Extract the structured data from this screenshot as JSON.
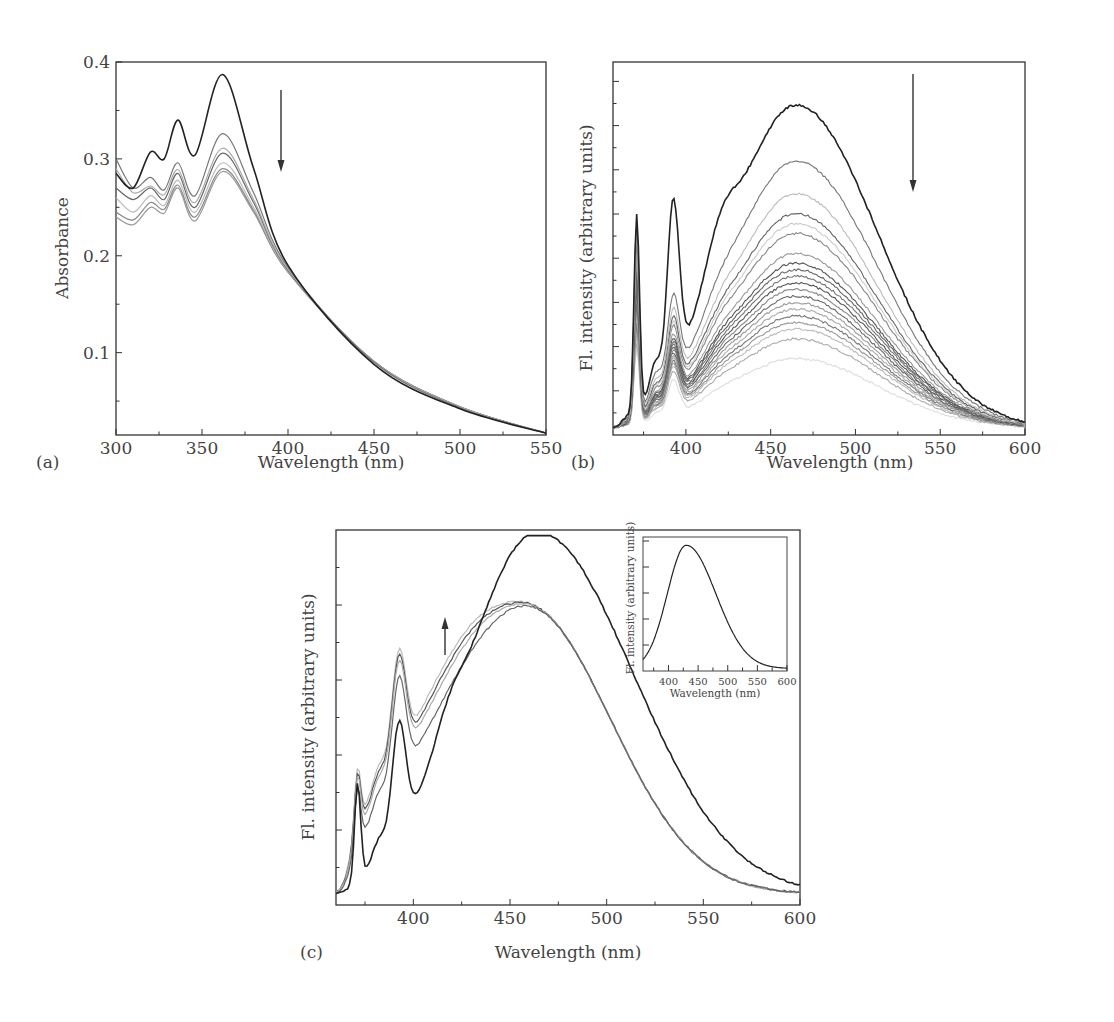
{
  "panels": {
    "a": {
      "tag": "(a)",
      "xlabel": "Wavelength (nm)",
      "ylabel": "Absorbance",
      "xticks": [
        "300",
        "350",
        "400",
        "450",
        "500",
        "550"
      ],
      "yticks": [
        "0.1",
        "0.2",
        "0.3",
        "0.4"
      ]
    },
    "b": {
      "tag": "(b)",
      "xlabel": "Wavelength (nm)",
      "ylabel": "Fl. intensity (arbitrary units)",
      "xticks": [
        "400",
        "450",
        "500",
        "550",
        "600"
      ]
    },
    "c": {
      "tag": "(c)",
      "xlabel": "Wavelength (nm)",
      "ylabel": "Fl. intensity (arbitrary units)",
      "xticks": [
        "400",
        "450",
        "500",
        "550",
        "600"
      ]
    },
    "inset": {
      "xlabel": "Wavelength (nm)",
      "ylabel": "Fl. intensity (arbitrary units)",
      "xticks": [
        "400",
        "450",
        "500",
        "550",
        "600"
      ]
    }
  },
  "chart_data": [
    {
      "panel": "a",
      "type": "line",
      "title": "",
      "xlabel": "Wavelength (nm)",
      "ylabel": "Absorbance",
      "xlim": [
        300,
        550
      ],
      "ylim": [
        0.015,
        0.4
      ],
      "x": [
        300,
        310,
        320,
        328,
        336,
        346,
        362,
        380,
        400,
        450,
        500,
        550
      ],
      "series": [
        {
          "name": "initial",
          "color": "#222222",
          "values": [
            0.285,
            0.27,
            0.307,
            0.3,
            0.34,
            0.304,
            0.387,
            0.29,
            0.19,
            0.088,
            0.042,
            0.017
          ]
        },
        {
          "name": "titration 1",
          "color": "#777777",
          "values": [
            0.3,
            0.27,
            0.281,
            0.268,
            0.296,
            0.262,
            0.326,
            0.265,
            0.188,
            0.09,
            0.043,
            0.017
          ]
        },
        {
          "name": "titration 2",
          "color": "#aaaaaa",
          "values": [
            0.29,
            0.265,
            0.272,
            0.263,
            0.289,
            0.255,
            0.311,
            0.258,
            0.186,
            0.091,
            0.044,
            0.017
          ]
        },
        {
          "name": "titration 3",
          "color": "#666666",
          "values": [
            0.27,
            0.258,
            0.27,
            0.258,
            0.285,
            0.25,
            0.306,
            0.255,
            0.185,
            0.091,
            0.044,
            0.017
          ]
        },
        {
          "name": "titration 4",
          "color": "#bbbbbb",
          "values": [
            0.26,
            0.245,
            0.262,
            0.252,
            0.278,
            0.245,
            0.296,
            0.25,
            0.184,
            0.091,
            0.044,
            0.017
          ]
        },
        {
          "name": "titration 5",
          "color": "#888888",
          "values": [
            0.245,
            0.237,
            0.255,
            0.248,
            0.273,
            0.24,
            0.29,
            0.247,
            0.183,
            0.091,
            0.044,
            0.017
          ]
        },
        {
          "name": "titration 6",
          "color": "#999999",
          "values": [
            0.24,
            0.232,
            0.25,
            0.244,
            0.27,
            0.236,
            0.287,
            0.245,
            0.183,
            0.091,
            0.044,
            0.017
          ]
        }
      ],
      "annotations": [
        {
          "type": "arrow",
          "direction": "down",
          "x": 395,
          "y_from": 0.37,
          "y_to": 0.285
        }
      ]
    },
    {
      "panel": "b",
      "type": "line",
      "title": "",
      "xlabel": "Wavelength (nm)",
      "ylabel": "Fl. intensity (arbitrary units)",
      "xlim": [
        357,
        600
      ],
      "ylim": [
        0,
        1
      ],
      "notes": "Series of ~20 emission spectra decreasing in intensity; peak ~465 nm, sharp Raman-like peaks at ~371 and ~392 nm",
      "series_peak_values": [
        0.98,
        0.81,
        0.71,
        0.65,
        0.62,
        0.59,
        0.53,
        0.5,
        0.48,
        0.46,
        0.44,
        0.42,
        0.4,
        0.38,
        0.36,
        0.34,
        0.32,
        0.3,
        0.27,
        0.21
      ],
      "peak_wavelength": 465,
      "annotations": [
        {
          "type": "arrow",
          "direction": "down",
          "x": 523,
          "y_from": 0.95,
          "y_to": 0.65
        }
      ]
    },
    {
      "panel": "c",
      "type": "line",
      "title": "",
      "xlabel": "Wavelength (nm)",
      "ylabel": "Fl. intensity (arbitrary units)",
      "xlim": [
        360,
        600
      ],
      "ylim": [
        0,
        1
      ],
      "series": [
        {
          "name": "initial",
          "color": "#222222",
          "peak_wavelength": 464,
          "peak": 0.98,
          "dip_405": 0.37
        },
        {
          "name": "titration 1",
          "color": "#666666",
          "peak_wavelength": 458,
          "peak": 0.78,
          "dip_405": 0.4
        },
        {
          "name": "titration 2",
          "color": "#aaaaaa",
          "peak_wavelength": 458,
          "peak": 0.78,
          "dip_405": 0.45
        },
        {
          "name": "titration 3",
          "color": "#555555",
          "peak_wavelength": 458,
          "peak": 0.78,
          "dip_405": 0.47
        },
        {
          "name": "titration 4",
          "color": "#bbbbbb",
          "peak_wavelength": 458,
          "peak": 0.78,
          "dip_405": 0.49
        }
      ],
      "annotations": [
        {
          "type": "arrow",
          "direction": "up",
          "x": 417,
          "y_from": 0.67,
          "y_to": 0.77
        }
      ]
    },
    {
      "panel": "inset",
      "type": "line",
      "title": "",
      "xlabel": "Wavelength (nm)",
      "ylabel": "Fl. intensity (arbitrary units)",
      "xlim": [
        357,
        600
      ],
      "ylim": [
        0,
        1
      ],
      "x": [
        357,
        370,
        390,
        410,
        430,
        450,
        470,
        500,
        530,
        560,
        600
      ],
      "series": [
        {
          "name": "inset",
          "color": "#222222",
          "values": [
            0.05,
            0.2,
            0.6,
            0.9,
            0.98,
            0.9,
            0.72,
            0.42,
            0.2,
            0.09,
            0.03
          ]
        }
      ]
    }
  ]
}
